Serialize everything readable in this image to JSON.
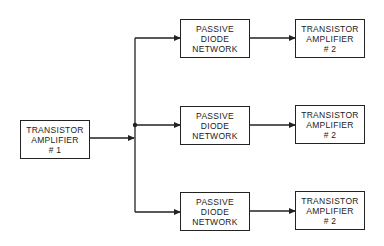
{
  "diagram": {
    "source": {
      "lines": [
        "TRANSISTOR",
        "AMPLIFIER",
        "# 1"
      ]
    },
    "branches": [
      {
        "network": {
          "lines": [
            "PASSIVE",
            "DIODE",
            "NETWORK"
          ]
        },
        "amplifier": {
          "lines": [
            "TRANSISTOR",
            "AMPLIFIER",
            "# 2"
          ]
        }
      },
      {
        "network": {
          "lines": [
            "PASSIVE",
            "DIODE",
            "NETWORK"
          ]
        },
        "amplifier": {
          "lines": [
            "TRANSISTOR",
            "AMPLIFIER",
            "# 2"
          ]
        }
      },
      {
        "network": {
          "lines": [
            "PASSIVE",
            "DIODE",
            "NETWORK"
          ]
        },
        "amplifier": {
          "lines": [
            "TRANSISTOR",
            "AMPLIFIER",
            "# 2"
          ]
        }
      }
    ],
    "colors": {
      "line": "#222222",
      "background": "#ffffff"
    }
  }
}
